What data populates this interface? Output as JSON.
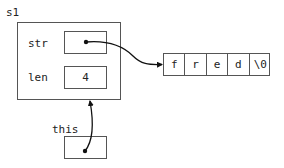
{
  "diagram": {
    "struct": {
      "name": "s1",
      "fields": [
        {
          "label": "str",
          "value": "",
          "kind": "pointer"
        },
        {
          "label": "len",
          "value": "4",
          "kind": "value"
        }
      ]
    },
    "array": {
      "cells": [
        "f",
        "r",
        "e",
        "d",
        "\\0"
      ]
    },
    "this_pointer": {
      "label": "this"
    },
    "arrows": [
      {
        "from": "s1.str",
        "to": "array[0]"
      },
      {
        "from": "this",
        "to": "s1"
      }
    ],
    "colors": {
      "line": "#555555",
      "text": "#222222",
      "arrow": "#111111"
    }
  }
}
